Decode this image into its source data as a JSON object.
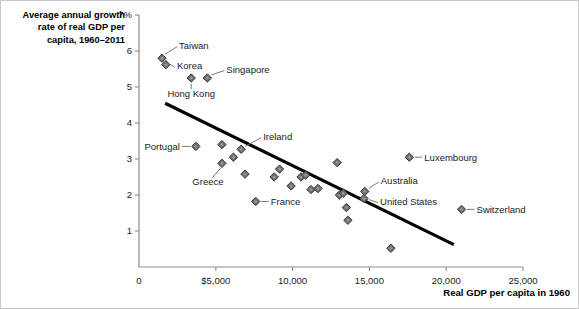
{
  "title": {
    "line1": "Average annual growth",
    "line2": "rate of real GDP per",
    "line3": "capita, 1960–2011"
  },
  "axis_title_x": "Real GDP per capita in 1960",
  "chart_data": {
    "type": "scatter",
    "title": "Average annual growth rate of real GDP per capita, 1960–2011",
    "xlabel": "Real GDP per capita in 1960",
    "ylabel": "Average annual growth rate of real GDP per capita, 1960-2011",
    "xlim": [
      0,
      25000
    ],
    "ylim": [
      0,
      7
    ],
    "grid": false,
    "legend": "none",
    "xticks": [
      0,
      5000,
      10000,
      15000,
      20000,
      25000
    ],
    "xticklabels": [
      "0",
      "$5,000",
      "10,000",
      "15,000",
      "20,000",
      "25,000"
    ],
    "yticks": [
      1,
      2,
      3,
      4,
      5,
      6,
      7
    ],
    "yticklabels": [
      "1",
      "2",
      "3",
      "4",
      "5",
      "6",
      "7%"
    ],
    "trendline": {
      "x0": 1700,
      "y0": 4.55,
      "x1": 20500,
      "y1": 0.62
    },
    "points": [
      {
        "label": "Taiwan",
        "x": 1500,
        "y": 5.8,
        "label_side": "right-up"
      },
      {
        "label": "Korea",
        "x": 1750,
        "y": 5.62,
        "label_side": "right"
      },
      {
        "label": "Hong Kong",
        "x": 3400,
        "y": 5.25,
        "label_side": "below"
      },
      {
        "label": "Singapore",
        "x": 4450,
        "y": 5.25,
        "label_side": "right"
      },
      {
        "label": "Portugal",
        "x": 3700,
        "y": 3.35,
        "label_side": "left"
      },
      {
        "label": "",
        "x": 5400,
        "y": 3.4,
        "label_side": "none"
      },
      {
        "label": "Greece",
        "x": 5400,
        "y": 2.88,
        "label_side": "below-left"
      },
      {
        "label": "",
        "x": 6150,
        "y": 3.05,
        "label_side": "none"
      },
      {
        "label": "",
        "x": 6900,
        "y": 2.58,
        "label_side": "none"
      },
      {
        "label": "Ireland",
        "x": 6650,
        "y": 3.27,
        "label_side": "right-up"
      },
      {
        "label": "",
        "x": 8800,
        "y": 2.5,
        "label_side": "none"
      },
      {
        "label": "",
        "x": 9150,
        "y": 2.72,
        "label_side": "none"
      },
      {
        "label": "France",
        "x": 7600,
        "y": 1.82,
        "label_side": "right"
      },
      {
        "label": "",
        "x": 9900,
        "y": 2.25,
        "label_side": "none"
      },
      {
        "label": "",
        "x": 10550,
        "y": 2.5,
        "label_side": "none"
      },
      {
        "label": "",
        "x": 10850,
        "y": 2.55,
        "label_side": "none"
      },
      {
        "label": "",
        "x": 11200,
        "y": 2.15,
        "label_side": "none"
      },
      {
        "label": "",
        "x": 11650,
        "y": 2.18,
        "label_side": "none"
      },
      {
        "label": "",
        "x": 12900,
        "y": 2.9,
        "label_side": "none"
      },
      {
        "label": "",
        "x": 13050,
        "y": 2.0,
        "label_side": "none"
      },
      {
        "label": "",
        "x": 13300,
        "y": 2.05,
        "label_side": "none"
      },
      {
        "label": "",
        "x": 13500,
        "y": 1.65,
        "label_side": "none"
      },
      {
        "label": "",
        "x": 13600,
        "y": 1.3,
        "label_side": "none"
      },
      {
        "label": "Australia",
        "x": 14700,
        "y": 2.1,
        "label_side": "right-up"
      },
      {
        "label": "United States",
        "x": 14650,
        "y": 1.9,
        "label_side": "right"
      },
      {
        "label": "",
        "x": 16400,
        "y": 0.52,
        "label_side": "none"
      },
      {
        "label": "Luxembourg",
        "x": 17600,
        "y": 3.05,
        "label_side": "right"
      },
      {
        "label": "Switzerland",
        "x": 21000,
        "y": 1.6,
        "label_side": "right"
      }
    ]
  }
}
